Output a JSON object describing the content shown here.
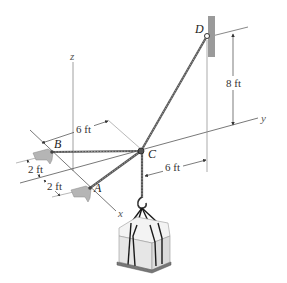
{
  "figure": {
    "type": "statics-3d-cable-diagram",
    "points": {
      "A": "A",
      "B": "B",
      "C": "C",
      "D": "D"
    },
    "axes": {
      "x": "x",
      "y": "y",
      "z": "z"
    },
    "dimensions": {
      "height_D": "8 ft",
      "B_to_C_offset": "6 ft",
      "C_to_D_offset": "6 ft",
      "B_offset": "2 ft",
      "A_offset": "2 ft"
    },
    "colors": {
      "line": "#333333",
      "rope": "#555555",
      "bracket": "#a9a9a9",
      "wall": "#9a9a9a",
      "crate": "#eeeeee",
      "strap": "#1a1a1a"
    }
  }
}
